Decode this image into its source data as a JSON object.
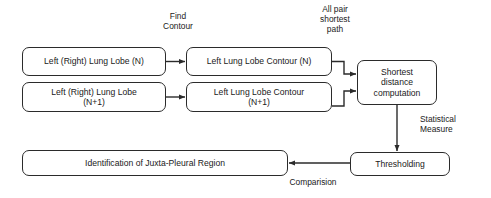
{
  "diagram": {
    "type": "flowchart",
    "background": "#ffffff",
    "stroke_color": "#2b2b2b",
    "text_color": "#1a1a1a",
    "nodes": [
      {
        "id": "lobe-n",
        "label": "Left (Right) Lung Lobe (N)",
        "shape": "rounded-rect"
      },
      {
        "id": "lobe-n1",
        "label": "Left (Right) Lung Lobe\n(N+1)",
        "shape": "rounded-rect"
      },
      {
        "id": "contour-n",
        "label": "Left Lung Lobe Contour (N)",
        "shape": "rounded-rect"
      },
      {
        "id": "contour-n1",
        "label": "Left Lung Lobe Contour\n(N+1)",
        "shape": "rounded-rect"
      },
      {
        "id": "shortest",
        "label": "Shortest\ndistance\ncomputation",
        "shape": "rounded-rect"
      },
      {
        "id": "thresholding",
        "label": "Thresholding",
        "shape": "rounded-rect"
      },
      {
        "id": "identify",
        "label": "Identification of Juxta-Pleural Region",
        "shape": "rounded-rect"
      }
    ],
    "edge_labels": [
      {
        "id": "find-contour",
        "label": "Find\nContour"
      },
      {
        "id": "all-pair",
        "label": "All pair\nshortest\npath"
      },
      {
        "id": "statistical",
        "label": "Statistical\nMeasure"
      },
      {
        "id": "comparision",
        "label": "Comparision"
      }
    ],
    "edges": [
      {
        "from": "lobe-n",
        "to": "contour-n",
        "label": "find-contour"
      },
      {
        "from": "lobe-n1",
        "to": "contour-n1",
        "label": "find-contour"
      },
      {
        "from": "contour-n",
        "to": "shortest",
        "label": "all-pair"
      },
      {
        "from": "contour-n1",
        "to": "shortest",
        "label": "all-pair"
      },
      {
        "from": "shortest",
        "to": "thresholding",
        "label": "statistical"
      },
      {
        "from": "thresholding",
        "to": "identify",
        "label": "comparision"
      }
    ]
  }
}
